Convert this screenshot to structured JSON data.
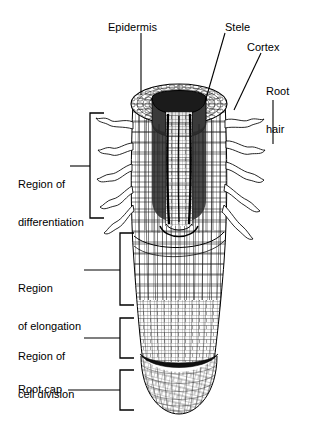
{
  "figure": {
    "background_color": "#ffffff",
    "ink_color": "#000000",
    "width": 310,
    "height": 431
  },
  "callout_labels": [
    {
      "id": "epidermis",
      "text": "Epidermis",
      "lines": [
        "Epidermis"
      ],
      "side": "top-left",
      "leader": "vertical"
    },
    {
      "id": "stele",
      "text": "Stele",
      "lines": [
        "Stele"
      ],
      "side": "top-center",
      "leader": "diagonal"
    },
    {
      "id": "cortex",
      "text": "Cortex",
      "lines": [
        "Cortex"
      ],
      "side": "top-right",
      "leader": "diagonal"
    },
    {
      "id": "root-hair",
      "text": "Root hair",
      "lines": [
        "Root",
        "hair"
      ],
      "side": "right",
      "leader": "vertical"
    }
  ],
  "region_labels": [
    {
      "id": "region-of-differentiation",
      "lines": [
        "Region of",
        "differentiation"
      ],
      "bracket": "left-facing",
      "zone": "root hair zone"
    },
    {
      "id": "region-of-elongation",
      "lines": [
        "Region",
        "of elongation"
      ],
      "bracket": "left-facing",
      "zone": "elongation zone"
    },
    {
      "id": "region-of-cell-division",
      "lines": [
        "Region of",
        "cell division"
      ],
      "bracket": "left-facing",
      "zone": "meristem"
    },
    {
      "id": "root-cap",
      "lines": [
        "Root cap"
      ],
      "bracket": "left-facing",
      "zone": "root cap"
    }
  ],
  "anatomy": {
    "structures": [
      "epidermis",
      "cortex",
      "stele",
      "root hairs",
      "root cap",
      "apical meristem"
    ]
  }
}
